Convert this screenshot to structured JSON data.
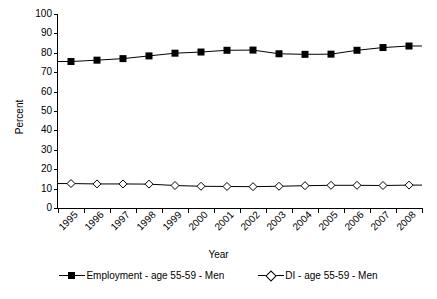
{
  "chart_data": {
    "type": "line",
    "title": "",
    "xlabel": "Year",
    "ylabel": "Percent",
    "ylim": [
      0,
      100
    ],
    "yticks": [
      0,
      10,
      20,
      30,
      40,
      50,
      60,
      70,
      80,
      90,
      100
    ],
    "grid": false,
    "legend_position": "bottom",
    "categories": [
      "1995",
      "1996",
      "1997",
      "1998",
      "1999",
      "2000",
      "2001",
      "2002",
      "2003",
      "2004",
      "2005",
      "2006",
      "2007",
      "2008"
    ],
    "series": [
      {
        "name": "Employment - age 55-59 - Men",
        "marker": "filled-square",
        "color": "#000000",
        "values": [
          75.5,
          76.2,
          77.0,
          78.4,
          79.8,
          80.4,
          81.3,
          81.4,
          79.5,
          79.2,
          79.3,
          81.3,
          82.7,
          83.5
        ]
      },
      {
        "name": "DI - age 55-59 - Men",
        "marker": "open-diamond",
        "color": "#000000",
        "values": [
          12.6,
          12.4,
          12.4,
          12.3,
          11.6,
          11.2,
          11.1,
          11.0,
          11.2,
          11.5,
          11.7,
          11.7,
          11.6,
          11.8
        ]
      }
    ]
  },
  "axis": {
    "y_title": "Percent",
    "x_title": "Year",
    "y_tick_labels": [
      "100",
      "90",
      "80",
      "70",
      "60",
      "50",
      "40",
      "30",
      "20",
      "10",
      "0"
    ],
    "x_tick_labels": [
      "1995",
      "1996",
      "1997",
      "1998",
      "1999",
      "2000",
      "2001",
      "2002",
      "2003",
      "2004",
      "2005",
      "2006",
      "2007",
      "2008"
    ]
  },
  "legend": {
    "entries": [
      {
        "label": "Employment - age 55-59 - Men"
      },
      {
        "label": "DI - age 55-59 - Men"
      }
    ]
  }
}
